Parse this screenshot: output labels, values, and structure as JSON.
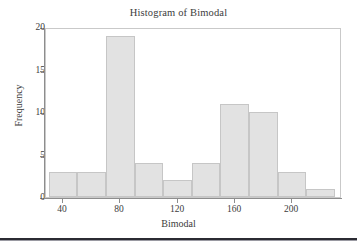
{
  "chart_data": {
    "type": "bar",
    "title": "Histogram of Bimodal",
    "xlabel": "Bimodal",
    "ylabel": "Frequency",
    "bin_width": 20,
    "bin_edges": [
      30,
      50,
      70,
      90,
      110,
      130,
      150,
      170,
      190,
      210,
      230
    ],
    "categories": [
      "30-50",
      "50-70",
      "70-90",
      "90-110",
      "110-130",
      "130-150",
      "150-170",
      "170-190",
      "190-210",
      "210-230"
    ],
    "values": [
      3,
      3,
      19,
      4,
      2,
      4,
      11,
      10,
      3,
      1
    ],
    "xlim": [
      28,
      235
    ],
    "ylim": [
      0,
      20
    ],
    "x_ticks": [
      40,
      80,
      120,
      160,
      200
    ],
    "x_tick_labels": [
      "40",
      "80",
      "120",
      "160",
      "200"
    ],
    "y_ticks": [
      0,
      5,
      10,
      15,
      20
    ],
    "y_tick_labels": [
      "0",
      "5",
      "10",
      "15",
      "20"
    ],
    "grid": false,
    "legend": null,
    "bar_fill_color": "#e2e2e2",
    "bar_edge_color": "#c6c6c6",
    "axis_color": "#8d8d8d",
    "text_color": "#3c3c3c",
    "background_color": "#ffffff"
  },
  "figure": {
    "bottom_rule_color": "#2b2b33"
  }
}
